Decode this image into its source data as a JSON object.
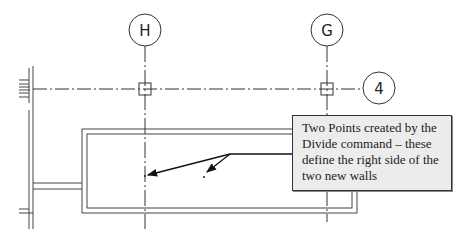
{
  "drawing": {
    "grid_bubbles": [
      {
        "label": "H",
        "cx": 145,
        "cy": 30
      },
      {
        "label": "G",
        "cx": 327,
        "cy": 30
      },
      {
        "label": "4",
        "cx": 379,
        "cy": 88
      }
    ],
    "callout": {
      "text": "Two Points created by the Divide command – these define the right side of the two new walls"
    },
    "colors": {
      "line": "#222222",
      "callout_bg": "#ececec"
    }
  }
}
